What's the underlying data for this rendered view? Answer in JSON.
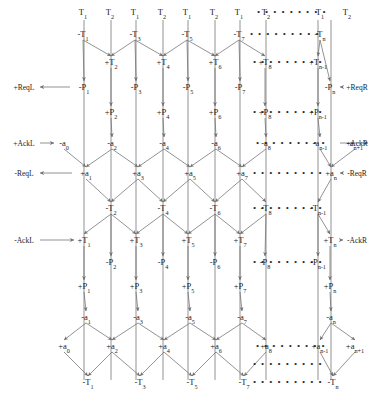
{
  "diagram": {
    "colors": {
      "line": "#6f6f6f",
      "text": "#1b1b1b",
      "background": "#ffffff"
    },
    "dots_glyph": "• • • • • • • • •",
    "top_row": [
      {
        "label": "T",
        "sub": "1",
        "x": 83,
        "y": 12
      },
      {
        "label": "T",
        "sub": "2",
        "x": 110,
        "y": 12
      },
      {
        "label": "T",
        "sub": "1",
        "x": 135,
        "y": 12
      },
      {
        "label": "T",
        "sub": "2",
        "x": 162,
        "y": 12
      },
      {
        "label": "T",
        "sub": "1",
        "x": 187,
        "y": 12
      },
      {
        "label": "T",
        "sub": "2",
        "x": 214,
        "y": 12
      },
      {
        "label": "T",
        "sub": "1",
        "x": 239,
        "y": 12
      },
      {
        "label": "T",
        "sub": "2",
        "x": 266,
        "y": 12
      },
      {
        "label": "T",
        "sub": "1",
        "x": 320,
        "y": 12
      },
      {
        "label": "T",
        "sub": "2",
        "x": 347,
        "y": 12
      }
    ],
    "rows": [
      {
        "name": "row-minus-T-odd",
        "y": 34,
        "nodes": [
          {
            "sign": "-",
            "label": "T",
            "sub": "1",
            "x": 83
          },
          {
            "sign": "-",
            "label": "T",
            "sub": "3",
            "x": 135
          },
          {
            "sign": "-",
            "label": "T",
            "sub": "5",
            "x": 187
          },
          {
            "sign": "-",
            "label": "T",
            "sub": "7",
            "x": 239
          },
          {
            "sign": "-",
            "label": "T",
            "sub": "n",
            "x": 320
          }
        ],
        "dots": {
          "x": 285
        }
      },
      {
        "name": "row-plus-T-even",
        "y": 62,
        "nodes": [
          {
            "sign": "+",
            "label": "T",
            "sub": "2",
            "x": 111
          },
          {
            "sign": "+",
            "label": "T",
            "sub": "4",
            "x": 163
          },
          {
            "sign": "+",
            "label": "T",
            "sub": "6",
            "x": 215
          },
          {
            "sign": "+",
            "label": "T",
            "sub": "8",
            "x": 265
          },
          {
            "sign": "+",
            "label": "T",
            "sub": "n-1",
            "x": 318
          }
        ],
        "dots": {
          "x": 288
        }
      },
      {
        "name": "row-minus-P-odd",
        "y": 87,
        "nodes": [
          {
            "sign": "-",
            "label": "P",
            "sub": "1",
            "x": 84
          },
          {
            "sign": "-",
            "label": "P",
            "sub": "3",
            "x": 136
          },
          {
            "sign": "-",
            "label": "P",
            "sub": "5",
            "x": 188
          },
          {
            "sign": "-",
            "label": "P",
            "sub": "7",
            "x": 240
          },
          {
            "sign": "-",
            "label": "P",
            "sub": "n",
            "x": 330
          }
        ]
      },
      {
        "name": "row-plus-P-even",
        "y": 112,
        "nodes": [
          {
            "sign": "+",
            "label": "P",
            "sub": "2",
            "x": 111
          },
          {
            "sign": "+",
            "label": "P",
            "sub": "4",
            "x": 163
          },
          {
            "sign": "+",
            "label": "P",
            "sub": "6",
            "x": 215
          },
          {
            "sign": "+",
            "label": "P",
            "sub": "8",
            "x": 265
          },
          {
            "sign": "+",
            "label": "P",
            "sub": "n-1",
            "x": 318
          }
        ],
        "dots": {
          "x": 288
        }
      },
      {
        "name": "row-minus-a-even",
        "y": 143,
        "nodes": [
          {
            "sign": "-",
            "label": "a",
            "sub": "0",
            "x": 64
          },
          {
            "sign": "-",
            "label": "a",
            "sub": "2",
            "x": 112
          },
          {
            "sign": "-",
            "label": "a",
            "sub": "4",
            "x": 164
          },
          {
            "sign": "-",
            "label": "a",
            "sub": "6",
            "x": 216
          },
          {
            "sign": "-",
            "label": "a",
            "sub": "8",
            "x": 266
          },
          {
            "sign": "-",
            "label": "a",
            "sub": "n-1",
            "x": 320
          },
          {
            "sign": "-",
            "label": "a",
            "sub": "n+1",
            "x": 355
          }
        ],
        "dots": {
          "x": 291
        }
      },
      {
        "name": "row-plus-a-odd",
        "y": 173,
        "nodes": [
          {
            "sign": "+",
            "label": "a",
            "sub": "1",
            "x": 86
          },
          {
            "sign": "+",
            "label": "a",
            "sub": "3",
            "x": 138
          },
          {
            "sign": "+",
            "label": "a",
            "sub": "5",
            "x": 190
          },
          {
            "sign": "+",
            "label": "a",
            "sub": "7",
            "x": 242
          },
          {
            "sign": "+",
            "label": "a",
            "sub": "n",
            "x": 331
          }
        ],
        "dots": {
          "x": 288
        }
      },
      {
        "name": "row-minus-T-even",
        "y": 208,
        "nodes": [
          {
            "sign": "-",
            "label": "T",
            "sub": "2",
            "x": 111
          },
          {
            "sign": "-",
            "label": "T",
            "sub": "4",
            "x": 163
          },
          {
            "sign": "-",
            "label": "T",
            "sub": "6",
            "x": 215
          },
          {
            "sign": "-",
            "label": "T",
            "sub": "8",
            "x": 266
          },
          {
            "sign": "-",
            "label": "T",
            "sub": "n-1",
            "x": 318
          }
        ],
        "dots": {
          "x": 288
        }
      },
      {
        "name": "row-plus-T-odd",
        "y": 240,
        "nodes": [
          {
            "sign": "+",
            "label": "T",
            "sub": "1",
            "x": 84
          },
          {
            "sign": "+",
            "label": "T",
            "sub": "3",
            "x": 136
          },
          {
            "sign": "+",
            "label": "T",
            "sub": "5",
            "x": 188
          },
          {
            "sign": "+",
            "label": "T",
            "sub": "7",
            "x": 240
          },
          {
            "sign": "+",
            "label": "T",
            "sub": "n",
            "x": 330
          }
        ]
      },
      {
        "name": "row-minus-P-even",
        "y": 262,
        "nodes": [
          {
            "sign": "-",
            "label": "P",
            "sub": "2",
            "x": 111
          },
          {
            "sign": "-",
            "label": "P",
            "sub": "4",
            "x": 163
          },
          {
            "sign": "-",
            "label": "P",
            "sub": "6",
            "x": 215
          },
          {
            "sign": "-",
            "label": "P",
            "sub": "8",
            "x": 265
          },
          {
            "sign": "-",
            "label": "P",
            "sub": "n-1",
            "x": 318
          }
        ],
        "dots": {
          "x": 288
        }
      },
      {
        "name": "row-plus-P-odd",
        "y": 286,
        "nodes": [
          {
            "sign": "+",
            "label": "P",
            "sub": "1",
            "x": 84
          },
          {
            "sign": "+",
            "label": "P",
            "sub": "3",
            "x": 136
          },
          {
            "sign": "+",
            "label": "P",
            "sub": "5",
            "x": 188
          },
          {
            "sign": "+",
            "label": "P",
            "sub": "7",
            "x": 240
          },
          {
            "sign": "+",
            "label": "P",
            "sub": "n",
            "x": 330
          }
        ]
      },
      {
        "name": "row-minus-a-odd",
        "y": 317,
        "nodes": [
          {
            "sign": "-",
            "label": "a",
            "sub": "1",
            "x": 86
          },
          {
            "sign": "-",
            "label": "a",
            "sub": "3",
            "x": 138
          },
          {
            "sign": "-",
            "label": "a",
            "sub": "5",
            "x": 190
          },
          {
            "sign": "-",
            "label": "a",
            "sub": "7",
            "x": 242
          },
          {
            "sign": "-",
            "label": "a",
            "sub": "n",
            "x": 331
          }
        ]
      },
      {
        "name": "row-plus-a-even",
        "y": 346,
        "nodes": [
          {
            "sign": "+",
            "label": "a",
            "sub": "0",
            "x": 64
          },
          {
            "sign": "+",
            "label": "a",
            "sub": "2",
            "x": 112
          },
          {
            "sign": "+",
            "label": "a",
            "sub": "4",
            "x": 164
          },
          {
            "sign": "+",
            "label": "a",
            "sub": "6",
            "x": 216
          },
          {
            "sign": "+",
            "label": "a",
            "sub": "8",
            "x": 266
          },
          {
            "sign": "+",
            "label": "a",
            "sub": "n-1",
            "x": 320
          },
          {
            "sign": "+",
            "label": "a",
            "sub": "n+1",
            "x": 355
          }
        ],
        "dots": {
          "x": 291
        }
      },
      {
        "name": "row-minus-T-bottom",
        "y": 382,
        "nodes": [
          {
            "sign": "-",
            "label": "T",
            "sub": "1",
            "x": 88
          },
          {
            "sign": "-",
            "label": "T",
            "sub": "3",
            "x": 140
          },
          {
            "sign": "-",
            "label": "T",
            "sub": "5",
            "x": 192
          },
          {
            "sign": "-",
            "label": "T",
            "sub": "7",
            "x": 244
          },
          {
            "sign": "-",
            "label": "T",
            "sub": "n",
            "x": 333
          }
        ],
        "dots": {
          "x": 288
        }
      }
    ],
    "extra_dots": [
      {
        "name": "dots-top-row",
        "x": 292,
        "y": 12
      },
      {
        "name": "dots-bottom-mid",
        "x": 288,
        "y": 364
      }
    ],
    "side_labels": [
      {
        "name": "label-plus-reql",
        "text": "+ReqL",
        "x": 24,
        "y": 87,
        "side": "left"
      },
      {
        "name": "label-plus-ackl",
        "text": "+AckL",
        "x": 24,
        "y": 143,
        "side": "left"
      },
      {
        "name": "label-minus-reql",
        "text": "-ReqL",
        "x": 24,
        "y": 173,
        "side": "left"
      },
      {
        "name": "label-minus-ackl",
        "text": "-AckL",
        "x": 24,
        "y": 240,
        "side": "left"
      },
      {
        "name": "label-plus-reqr",
        "text": "+ReqR",
        "x": 357,
        "y": 87,
        "side": "right"
      },
      {
        "name": "label-plus-ackr",
        "text": "+AckR",
        "x": 357,
        "y": 143,
        "side": "right"
      },
      {
        "name": "label-minus-reqr",
        "text": "-ReqR",
        "x": 357,
        "y": 173,
        "side": "right"
      },
      {
        "name": "label-minus-ackr",
        "text": "-AckR",
        "x": 357,
        "y": 240,
        "side": "right"
      }
    ]
  }
}
